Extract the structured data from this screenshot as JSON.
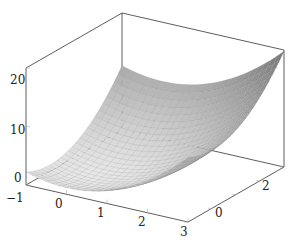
{
  "chart_data": {
    "type": "surface3d",
    "title": "",
    "function": "z = x^2 + y^2 (paraboloid bowl)",
    "x_range": [
      -1,
      3
    ],
    "y_range": [
      -1,
      3
    ],
    "z_range": [
      0,
      20
    ],
    "x_ticks": [
      "-1",
      "0",
      "1",
      "2",
      "3"
    ],
    "y_ticks": [
      "0",
      "2"
    ],
    "z_ticks": [
      "0",
      "10",
      "20"
    ],
    "xlabel": "",
    "ylabel": "",
    "zlabel": "",
    "grid_samples": 25,
    "colormap": "grayscale",
    "colors": {
      "dark": "#6a6a6a",
      "light": "#e8e8e8",
      "axis": "#333333",
      "tick": "#b0b0b0"
    },
    "box": true,
    "legend": null
  },
  "axes": {
    "z_tick_labels": [
      {
        "label": "20",
        "x": 10,
        "y": 84
      },
      {
        "label": "10",
        "x": 10,
        "y": 134
      },
      {
        "label": "0",
        "x": 14,
        "y": 182
      }
    ],
    "x_tick_labels": [
      {
        "label": "−1",
        "x": 6,
        "y": 202
      },
      {
        "label": "0",
        "x": 55,
        "y": 208
      },
      {
        "label": "1",
        "x": 97,
        "y": 217
      },
      {
        "label": "2",
        "x": 138,
        "y": 226
      },
      {
        "label": "3",
        "x": 180,
        "y": 236
      }
    ],
    "y_tick_labels": [
      {
        "label": "0",
        "x": 215,
        "y": 217
      },
      {
        "label": "2",
        "x": 262,
        "y": 190
      }
    ]
  }
}
